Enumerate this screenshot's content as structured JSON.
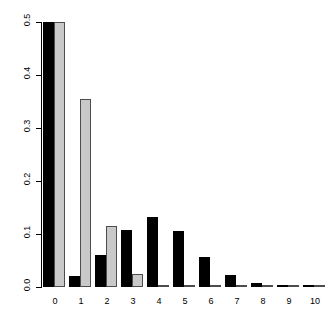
{
  "figure": {
    "title_faint": "",
    "background": "#ffffff"
  },
  "chart_data": {
    "type": "bar",
    "title": "",
    "subtitle": "",
    "xlabel": "",
    "ylabel": "",
    "categories": [
      "0",
      "1",
      "2",
      "3",
      "4",
      "5",
      "6",
      "7",
      "8",
      "9",
      "10"
    ],
    "series": [
      {
        "name": "series-1",
        "color": "#000000",
        "values": [
          0.5,
          0.02,
          0.06,
          0.108,
          0.133,
          0.105,
          0.057,
          0.022,
          0.008,
          0.003,
          0.001
        ]
      },
      {
        "name": "series-2",
        "color": "#c9c9c9",
        "values": [
          0.5,
          0.355,
          0.115,
          0.025,
          0.004,
          0.001,
          0.0,
          0.0,
          0.0,
          0.0,
          0.0
        ]
      }
    ],
    "ylim": [
      0.0,
      0.5
    ],
    "xlim_categories": 11,
    "yticks": [
      0.0,
      0.1,
      0.2,
      0.3,
      0.4,
      0.5
    ],
    "ytick_labels": [
      "0.0",
      "0.1",
      "0.2",
      "0.3",
      "0.4",
      "0.5"
    ],
    "xtick_labels": [
      "0",
      "1",
      "2",
      "3",
      "4",
      "5",
      "6",
      "7",
      "8",
      "9",
      "10"
    ],
    "grid": false,
    "legend": "none",
    "bar_orientation": "vertical",
    "grouping": "side-by-side"
  },
  "colors": {
    "series_1": "#000000",
    "series_2": "#c9c9c9",
    "series_2_border": "#4d4d4d",
    "axis": "#000000",
    "background": "#ffffff"
  }
}
